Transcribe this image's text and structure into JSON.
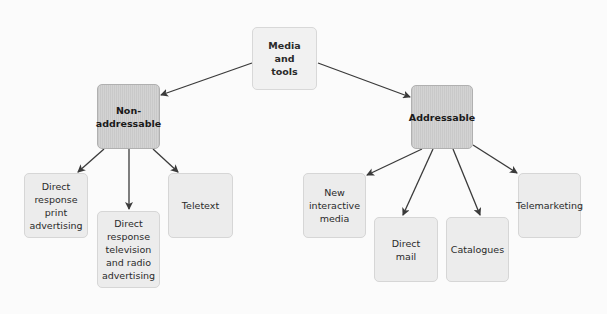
{
  "diagram": {
    "type": "tree",
    "root": {
      "id": "media",
      "label": "Media\nand\ntools"
    },
    "branches": [
      {
        "id": "nonaddr",
        "label": "Non-\naddressable",
        "children": [
          {
            "id": "print",
            "label": "Direct\nresponse\nprint\nadvertising"
          },
          {
            "id": "tv",
            "label": "Direct\nresponse\ntelevision\nand radio\nadvertising"
          },
          {
            "id": "teletext",
            "label": "Teletext"
          }
        ]
      },
      {
        "id": "addr",
        "label": "Addressable",
        "children": [
          {
            "id": "newmedia",
            "label": "New\ninteractive\nmedia"
          },
          {
            "id": "mail",
            "label": "Direct\nmail"
          },
          {
            "id": "catalogues",
            "label": "Catalogues"
          },
          {
            "id": "telemarketing",
            "label": "Telemarketing"
          }
        ]
      }
    ],
    "colors": {
      "edge": "#3a3a3a",
      "leaf_fill": "#ececec",
      "mid_fill": "#cecece",
      "root_fill": "#f1f1f1"
    }
  }
}
